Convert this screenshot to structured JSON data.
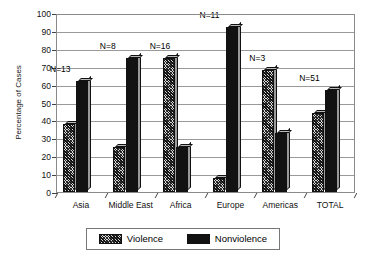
{
  "chart_data": {
    "type": "bar",
    "title": "",
    "xlabel": "",
    "ylabel": "Percentage of Cases",
    "ylim": [
      0,
      100
    ],
    "yticks": [
      0,
      10,
      20,
      30,
      40,
      50,
      60,
      70,
      80,
      90,
      100
    ],
    "grid": true,
    "legend_position": "bottom",
    "categories": [
      "Asia",
      "Middle East",
      "Africa",
      "Europe",
      "Americas",
      "TOTAL"
    ],
    "series": [
      {
        "name": "Violence",
        "values": [
          38,
          25,
          75,
          8,
          68,
          44
        ]
      },
      {
        "name": "Nonviolence",
        "values": [
          62,
          75,
          25,
          92,
          33,
          57
        ]
      }
    ],
    "annotations": [
      {
        "text": "N=13",
        "category": "Asia"
      },
      {
        "text": "N=8",
        "category": "Middle East"
      },
      {
        "text": "N=16",
        "category": "Africa"
      },
      {
        "text": "N=11",
        "category": "Europe"
      },
      {
        "text": "N=3",
        "category": "Americas"
      },
      {
        "text": "N=51",
        "category": "TOTAL"
      }
    ],
    "colors": {
      "violence": "#3d3d3d",
      "nonviolence": "#121212",
      "grid": "#9a9a9a",
      "axis": "#444444",
      "background": "#ffffff"
    }
  },
  "axis": {
    "y_title": "Percentage of Cases",
    "y_tick_labels": [
      "0",
      "10",
      "20",
      "30",
      "40",
      "50",
      "60",
      "70",
      "80",
      "90",
      "100"
    ],
    "x_tick_labels": [
      "Asia",
      "Middle East",
      "Africa",
      "Europe",
      "Americas",
      "TOTAL"
    ]
  },
  "annotations": {
    "items": [
      "N=13",
      "N=8",
      "N=16",
      "N=11",
      "N=3",
      "N=51"
    ]
  },
  "legend": {
    "items": [
      {
        "label": "Violence",
        "swatch": "hatched-pattern-swatch"
      },
      {
        "label": "Nonviolence",
        "swatch": "solid-black-swatch"
      }
    ]
  }
}
